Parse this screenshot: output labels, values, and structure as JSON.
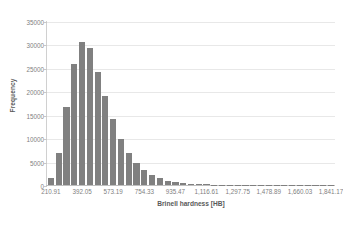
{
  "chart_data": {
    "type": "bar",
    "title": "",
    "subtitle": "",
    "xlabel": "Brinell hardness [HB]",
    "ylabel": "Frequency",
    "grid": true,
    "legend": "none",
    "xlim": [
      165.62,
      1886.45
    ],
    "ylim": [
      0,
      35000
    ],
    "y_ticks": [
      0,
      5000,
      10000,
      15000,
      20000,
      25000,
      30000,
      35000
    ],
    "y_tick_labels": [
      "0",
      "5000",
      "10000",
      "15000",
      "20000",
      "25000",
      "30000",
      "35000"
    ],
    "x_tick_labels": [
      "210.91",
      "392.05",
      "573.19",
      "754.33",
      "935.47",
      "1,116.61",
      "1,297.75",
      "1,478.89",
      "1,660.03",
      "1,841.17"
    ],
    "x_tick_values": [
      210.91,
      392.05,
      573.19,
      754.33,
      935.47,
      1116.61,
      1297.75,
      1478.89,
      1660.03,
      1841.17
    ],
    "bin_width": 45.285,
    "bar_color": "#808080",
    "gridline_color": "#e8e8e8",
    "axis_text_color": "#7f7f7f",
    "title_text_color": "#595959",
    "categories": [
      "210.91",
      "256.20",
      "301.48",
      "346.77",
      "392.05",
      "437.34",
      "482.62",
      "527.91",
      "573.19",
      "618.48",
      "663.76",
      "709.05",
      "754.33",
      "799.62",
      "844.90",
      "890.19",
      "935.47",
      "980.76",
      "1,026.04",
      "1,071.33",
      "1,116.61",
      "1,161.90",
      "1,207.18",
      "1,252.47",
      "1,297.75",
      "1,343.04",
      "1,388.32",
      "1,433.61",
      "1,478.89",
      "1,524.18",
      "1,569.46",
      "1,614.75",
      "1,660.03",
      "1,705.32",
      "1,750.60",
      "1,795.89",
      "1,841.17"
    ],
    "values": [
      1400,
      6900,
      16700,
      25900,
      30500,
      29200,
      24200,
      19000,
      14100,
      9800,
      6900,
      4700,
      3200,
      2200,
      1500,
      950,
      620,
      400,
      260,
      170,
      120,
      90,
      70,
      55,
      45,
      35,
      28,
      22,
      18,
      14,
      11,
      9,
      7,
      5,
      4,
      3,
      2
    ]
  }
}
